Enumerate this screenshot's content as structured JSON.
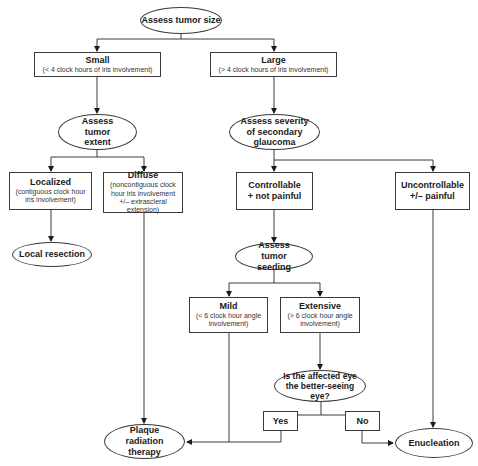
{
  "diagram": {
    "type": "flowchart",
    "nodes": {
      "assess_size": {
        "title": "Assess tumor size"
      },
      "small": {
        "title": "Small",
        "sub": "(< 4 clock hours of iris involvement)"
      },
      "large": {
        "title": "Large",
        "sub": "(> 4 clock hours of iris involvement)"
      },
      "assess_extent": {
        "title": "Assess tumor extent"
      },
      "assess_glaucoma": {
        "title": "Assess severity of secondary glaucoma"
      },
      "localized": {
        "title": "Localized",
        "sub": "(contiguous clock hour iris involvement)"
      },
      "diffuse": {
        "title": "Diffuse",
        "sub": "(noncontiguous clock hour iris involvement +/– extrascleral extension)"
      },
      "controllable": {
        "title": "Controllable + not painful"
      },
      "uncontrollable": {
        "title": "Uncontrollable +/– painful"
      },
      "local_resection": {
        "title": "Local resection"
      },
      "assess_seeding": {
        "title": "Assess tumor seeding"
      },
      "mild": {
        "title": "Mild",
        "sub": "(< 6 clock hour angle involvement)"
      },
      "extensive": {
        "title": "Extensive",
        "sub": "(> 6 clock hour angle involvement)"
      },
      "question": {
        "title": "Is the affected eye the better-seeing eye?"
      },
      "yes": {
        "title": "Yes"
      },
      "no": {
        "title": "No"
      },
      "plaque": {
        "title": "Plaque radiation therapy"
      },
      "enucleation": {
        "title": "Enucleation"
      }
    },
    "edges": [
      [
        "assess_size",
        "small"
      ],
      [
        "assess_size",
        "large"
      ],
      [
        "small",
        "assess_extent"
      ],
      [
        "large",
        "assess_glaucoma"
      ],
      [
        "assess_extent",
        "localized"
      ],
      [
        "assess_extent",
        "diffuse"
      ],
      [
        "assess_glaucoma",
        "controllable"
      ],
      [
        "assess_glaucoma",
        "uncontrollable"
      ],
      [
        "localized",
        "local_resection"
      ],
      [
        "diffuse",
        "plaque"
      ],
      [
        "controllable",
        "assess_seeding"
      ],
      [
        "assess_seeding",
        "mild"
      ],
      [
        "assess_seeding",
        "extensive"
      ],
      [
        "mild",
        "plaque"
      ],
      [
        "extensive",
        "question"
      ],
      [
        "question",
        "yes"
      ],
      [
        "question",
        "no"
      ],
      [
        "yes",
        "plaque"
      ],
      [
        "no",
        "enucleation"
      ],
      [
        "uncontrollable",
        "enucleation"
      ]
    ]
  }
}
